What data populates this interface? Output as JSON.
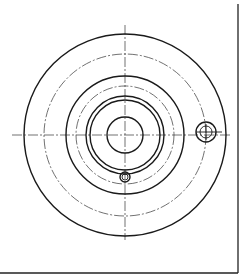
{
  "drawing": {
    "title": "Flange top view (technical drawing)",
    "line_color": "#1a1a1a",
    "background": "#ffffff",
    "features": [
      {
        "name": "outer-rim-circle",
        "style": "solid"
      },
      {
        "name": "outer-bolt-circle",
        "style": "center"
      },
      {
        "name": "hub-circle",
        "style": "solid"
      },
      {
        "name": "inner-bolt-circle",
        "style": "center"
      },
      {
        "name": "boss-outer-circle",
        "style": "solid"
      },
      {
        "name": "boss-inner-circle",
        "style": "solid"
      },
      {
        "name": "bore-circle",
        "style": "solid"
      },
      {
        "name": "side-hole-outer",
        "style": "solid"
      },
      {
        "name": "side-hole-inner",
        "style": "thin"
      },
      {
        "name": "bottom-hole",
        "style": "solid"
      }
    ]
  }
}
